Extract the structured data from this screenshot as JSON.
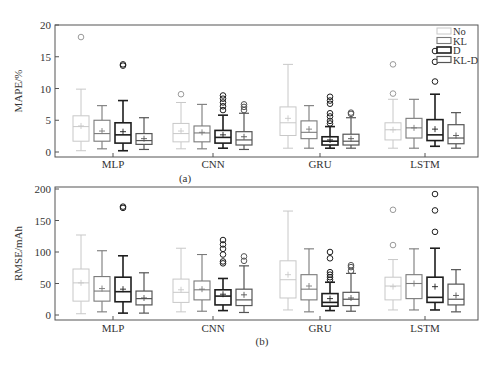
{
  "chart_data": [
    {
      "panel_label": "(a)",
      "type": "box",
      "title": "",
      "xlabel": "",
      "ylabel": "MAPE/%",
      "ylim": [
        0,
        20
      ],
      "yticks": [
        0,
        5,
        10,
        15,
        20
      ],
      "categories": [
        "MLP",
        "CNN",
        "GRU",
        "LSTM"
      ],
      "legend": {
        "position": "upper right",
        "entries": [
          "No",
          "KL",
          "D",
          "KL-D"
        ]
      },
      "grid": false,
      "series": [
        {
          "name": "No",
          "boxes": [
            {
              "category": "MLP",
              "whislo": 0.2,
              "q1": 1.7,
              "med": 4.0,
              "q3": 5.7,
              "whishi": 9.9,
              "mean": 4.1,
              "fliers": [
                18.1
              ]
            },
            {
              "category": "CNN",
              "whislo": 0.5,
              "q1": 1.6,
              "med": 2.9,
              "q3": 4.5,
              "whishi": 7.8,
              "mean": 3.3,
              "fliers": [
                9.1
              ]
            },
            {
              "category": "GRU",
              "whislo": 0.6,
              "q1": 2.6,
              "med": 4.6,
              "q3": 7.1,
              "whishi": 13.8,
              "mean": 5.3,
              "fliers": []
            },
            {
              "category": "LSTM",
              "whislo": 0.6,
              "q1": 1.9,
              "med": 3.5,
              "q3": 4.6,
              "whishi": 8.3,
              "mean": 3.5,
              "fliers": [
                9.2,
                13.8
              ]
            }
          ]
        },
        {
          "name": "KL",
          "boxes": [
            {
              "category": "MLP",
              "whislo": 0.5,
              "q1": 1.7,
              "med": 2.9,
              "q3": 5.0,
              "whishi": 7.3,
              "mean": 3.3,
              "fliers": []
            },
            {
              "category": "CNN",
              "whislo": 0.5,
              "q1": 1.6,
              "med": 3.0,
              "q3": 4.1,
              "whishi": 7.5,
              "mean": 3.1,
              "fliers": []
            },
            {
              "category": "GRU",
              "whislo": 0.6,
              "q1": 2.1,
              "med": 3.1,
              "q3": 4.9,
              "whishi": 7.3,
              "mean": 3.6,
              "fliers": []
            },
            {
              "category": "LSTM",
              "whislo": 0.6,
              "q1": 2.2,
              "med": 3.8,
              "q3": 5.3,
              "whishi": 8.3,
              "mean": 3.8,
              "fliers": []
            }
          ]
        },
        {
          "name": "D",
          "boxes": [
            {
              "category": "MLP",
              "whislo": 0.2,
              "q1": 1.4,
              "med": 2.7,
              "q3": 4.6,
              "whishi": 8.1,
              "mean": 3.2,
              "fliers": [
                13.6,
                13.8
              ]
            },
            {
              "category": "CNN",
              "whislo": 0.6,
              "q1": 1.4,
              "med": 2.3,
              "q3": 3.4,
              "whishi": 5.8,
              "mean": 2.7,
              "fliers": [
                6.6,
                7.2,
                7.8,
                8.4,
                8.9
              ]
            },
            {
              "category": "GRU",
              "whislo": 0.6,
              "q1": 1.1,
              "med": 1.7,
              "q3": 2.4,
              "whishi": 4.0,
              "mean": 1.9,
              "fliers": [
                4.5,
                4.9,
                5.6,
                6.1,
                7.6,
                8.1,
                8.7
              ]
            },
            {
              "category": "LSTM",
              "whislo": 0.9,
              "q1": 1.8,
              "med": 2.7,
              "q3": 5.1,
              "whishi": 9.1,
              "mean": 3.6,
              "fliers": [
                11.1,
                14.2,
                15.9
              ]
            }
          ]
        },
        {
          "name": "KL-D",
          "boxes": [
            {
              "category": "MLP",
              "whislo": 0.4,
              "q1": 1.2,
              "med": 1.8,
              "q3": 2.9,
              "whishi": 5.4,
              "mean": 2.1,
              "fliers": []
            },
            {
              "category": "CNN",
              "whislo": 0.4,
              "q1": 1.1,
              "med": 1.9,
              "q3": 3.2,
              "whishi": 6.1,
              "mean": 2.4,
              "fliers": [
                6.6,
                7.1,
                7.5
              ]
            },
            {
              "category": "GRU",
              "whislo": 0.6,
              "q1": 1.1,
              "med": 1.7,
              "q3": 2.8,
              "whishi": 5.4,
              "mean": 2.1,
              "fliers": [
                6.0,
                6.2
              ]
            },
            {
              "category": "LSTM",
              "whislo": 0.6,
              "q1": 1.3,
              "med": 2.2,
              "q3": 4.3,
              "whishi": 6.2,
              "mean": 2.6,
              "fliers": []
            }
          ]
        }
      ]
    },
    {
      "panel_label": "(b)",
      "type": "box",
      "title": "",
      "xlabel": "",
      "ylabel": "RMSE/mAh",
      "ylim": [
        0,
        200
      ],
      "yticks": [
        0,
        50,
        100,
        150,
        200
      ],
      "categories": [
        "MLP",
        "CNN",
        "GRU",
        "LSTM"
      ],
      "legend": {
        "position": "none",
        "entries": []
      },
      "grid": false,
      "series": [
        {
          "name": "No",
          "boxes": [
            {
              "category": "MLP",
              "whislo": 2,
              "q1": 22,
              "med": 51,
              "q3": 73,
              "whishi": 127,
              "mean": 51,
              "fliers": []
            },
            {
              "category": "CNN",
              "whislo": 5,
              "q1": 20,
              "med": 36,
              "q3": 57,
              "whishi": 106,
              "mean": 40,
              "fliers": []
            },
            {
              "category": "GRU",
              "whislo": 8,
              "q1": 27,
              "med": 56,
              "q3": 86,
              "whishi": 165,
              "mean": 64,
              "fliers": []
            },
            {
              "category": "LSTM",
              "whislo": 8,
              "q1": 24,
              "med": 46,
              "q3": 60,
              "whishi": 88,
              "mean": 45,
              "fliers": [
                111,
                167
              ]
            }
          ]
        },
        {
          "name": "KL",
          "boxes": [
            {
              "category": "MLP",
              "whislo": 5,
              "q1": 22,
              "med": 38,
              "q3": 61,
              "whishi": 102,
              "mean": 42,
              "fliers": []
            },
            {
              "category": "CNN",
              "whislo": 6,
              "q1": 24,
              "med": 40,
              "q3": 54,
              "whishi": 96,
              "mean": 41,
              "fliers": []
            },
            {
              "category": "GRU",
              "whislo": 5,
              "q1": 24,
              "med": 41,
              "q3": 64,
              "whishi": 105,
              "mean": 46,
              "fliers": []
            },
            {
              "category": "LSTM",
              "whislo": 8,
              "q1": 26,
              "med": 50,
              "q3": 64,
              "whishi": 105,
              "mean": 50,
              "fliers": []
            }
          ]
        },
        {
          "name": "D",
          "boxes": [
            {
              "category": "MLP",
              "whislo": 3,
              "q1": 21,
              "med": 37,
              "q3": 60,
              "whishi": 94,
              "mean": 41,
              "fliers": [
                170,
                172
              ]
            },
            {
              "category": "CNN",
              "whislo": 7,
              "q1": 16,
              "med": 30,
              "q3": 40,
              "whishi": 58,
              "mean": 33,
              "fliers": [
                82,
                85,
                96,
                105,
                112,
                119
              ]
            },
            {
              "category": "GRU",
              "whislo": 7,
              "q1": 14,
              "med": 20,
              "q3": 34,
              "whishi": 52,
              "mean": 26,
              "fliers": [
                56,
                60,
                64,
                68,
                90,
                100
              ]
            },
            {
              "category": "LSTM",
              "whislo": 8,
              "q1": 20,
              "med": 28,
              "q3": 60,
              "whishi": 106,
              "mean": 45,
              "fliers": [
                132,
                166,
                192
              ]
            }
          ]
        },
        {
          "name": "KL-D",
          "boxes": [
            {
              "category": "MLP",
              "whislo": 3,
              "q1": 16,
              "med": 26,
              "q3": 38,
              "whishi": 67,
              "mean": 27,
              "fliers": []
            },
            {
              "category": "CNN",
              "whislo": 4,
              "q1": 15,
              "med": 24,
              "q3": 41,
              "whishi": 78,
              "mean": 32,
              "fliers": [
                86,
                93
              ]
            },
            {
              "category": "GRU",
              "whislo": 6,
              "q1": 15,
              "med": 25,
              "q3": 36,
              "whishi": 66,
              "mean": 27,
              "fliers": [
                70,
                76,
                79
              ]
            },
            {
              "category": "LSTM",
              "whislo": 5,
              "q1": 16,
              "med": 25,
              "q3": 49,
              "whishi": 72,
              "mean": 31,
              "fliers": []
            }
          ]
        }
      ]
    }
  ],
  "styles": {
    "series_colors": {
      "No": "#c8c8c8",
      "KL": "#7a7a7a",
      "D": "#1e1e1e",
      "KL-D": "#555555"
    },
    "series_widths": {
      "No": 1,
      "KL": 1.1,
      "D": 1.6,
      "KL-D": 1.2
    },
    "axis_color": "#555555",
    "text_color": "#333333"
  }
}
